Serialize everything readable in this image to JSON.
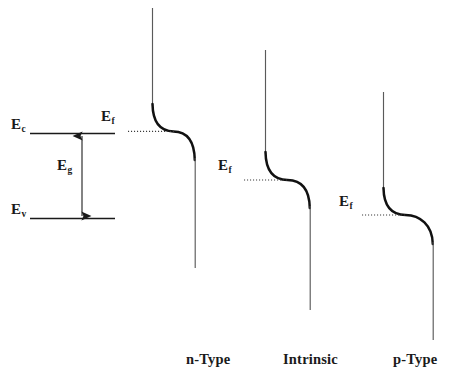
{
  "figure": {
    "background_color": "#ffffff",
    "line_color": "#1a1a1a",
    "curve_color": "#111111",
    "width": 466,
    "height": 386
  },
  "band_panel": {
    "conduction_band_label": "E",
    "conduction_band_sub": "c",
    "gap_label": "E",
    "gap_sub": "g",
    "valence_band_label": "E",
    "valence_band_sub": "v",
    "conduction_line": {
      "x1": 30,
      "x2": 115,
      "y": 133
    },
    "valence_line": {
      "x1": 30,
      "x2": 115,
      "y": 218
    },
    "gap_arrow": {
      "x": 82,
      "y_top": 133,
      "y_bottom": 218,
      "double_headed": true
    }
  },
  "diagrams": [
    {
      "id": "n-type",
      "caption": "n-Type",
      "fermi_label": "E",
      "fermi_sub": "f",
      "fermi_level_y": 131,
      "top_line": {
        "x": 152,
        "y1": 8,
        "y2": 106
      },
      "bottom_line": {
        "x": 195,
        "y1": 160,
        "y2": 268
      },
      "dotted_line": {
        "x1": 128,
        "x2": 173,
        "y": 131
      },
      "curve": {
        "x_start": 152,
        "y_start": 106,
        "x_end": 195,
        "y_end": 160
      }
    },
    {
      "id": "intrinsic",
      "caption": "Intrinsic",
      "fermi_label": "E",
      "fermi_sub": "f",
      "fermi_level_y": 180,
      "top_line": {
        "x": 265,
        "y1": 50,
        "y2": 154
      },
      "bottom_line": {
        "x": 310,
        "y1": 208,
        "y2": 310
      },
      "dotted_line": {
        "x1": 244,
        "x2": 286,
        "y": 180
      },
      "curve": {
        "x_start": 265,
        "y_start": 154,
        "x_end": 310,
        "y_end": 208
      }
    },
    {
      "id": "p-type",
      "caption": "p-Type",
      "fermi_label": "E",
      "fermi_sub": "f",
      "fermi_level_y": 215,
      "top_line": {
        "x": 383,
        "y1": 92,
        "y2": 190
      },
      "bottom_line": {
        "x": 433,
        "y1": 244,
        "y2": 340
      },
      "dotted_line": {
        "x1": 362,
        "x2": 404,
        "y": 215
      },
      "curve": {
        "x_start": 383,
        "y_start": 190,
        "x_end": 433,
        "y_end": 244
      }
    }
  ]
}
